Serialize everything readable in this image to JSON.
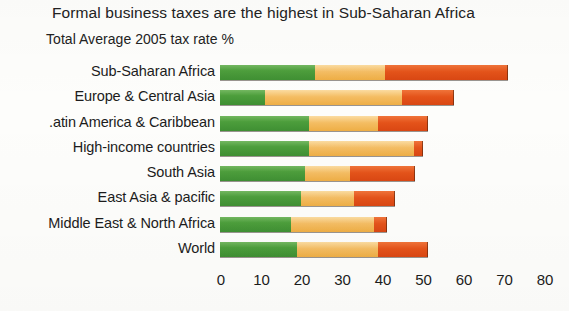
{
  "chart_data": {
    "type": "bar",
    "orientation": "horizontal",
    "stacked": true,
    "title": "Formal business taxes are the highest in Sub-Saharan Africa",
    "subtitle": "Total Average 2005 tax rate %",
    "xlabel": "",
    "ylabel": "",
    "xlim": [
      0,
      80
    ],
    "xticks": [
      0,
      10,
      20,
      30,
      40,
      50,
      60,
      70,
      80
    ],
    "grid": false,
    "legend": "none",
    "categories": [
      "Sub-Saharan Africa",
      ".atin America & Caribbean",
      "Europe & Central Asia",
      "High-income countries",
      "South Asia",
      "East Asia & pacific",
      "Middle East & North Africa",
      "World"
    ],
    "series": [
      {
        "name": "profit-tax",
        "color": "#4d9e3c",
        "values": [
          23.5,
          11,
          22,
          22,
          21,
          20,
          17.5,
          19
        ]
      },
      {
        "name": "labor-tax",
        "color": "#f4bd63",
        "values": [
          17.2,
          34,
          17,
          26,
          11,
          13,
          20.5,
          20
        ]
      },
      {
        "name": "other-taxes",
        "color": "#e4531a",
        "values": [
          30.2,
          12.5,
          12,
          2,
          16,
          10,
          3,
          12
        ]
      }
    ],
    "bars": [
      {
        "label": "Sub-Saharan Africa",
        "segments": [
          23.5,
          17.2,
          30.2
        ],
        "total": 71
      },
      {
        "label": "Europe & Central Asia",
        "segments": [
          11,
          34,
          12.5
        ],
        "total": 57.5
      },
      {
        "label": ".atin America & Caribbean",
        "segments": [
          22,
          17,
          12
        ],
        "total": 51
      },
      {
        "label": "High-income countries",
        "segments": [
          22,
          26,
          2
        ],
        "total": 50
      },
      {
        "label": "South Asia",
        "segments": [
          21,
          11,
          16
        ],
        "total": 48
      },
      {
        "label": "East Asia & pacific",
        "segments": [
          20,
          13,
          10
        ],
        "total": 43
      },
      {
        "label": "Middle East & North Africa",
        "segments": [
          17.5,
          20.5,
          3
        ],
        "total": 41
      },
      {
        "label": "World",
        "segments": [
          19,
          20,
          12
        ],
        "total": 51
      }
    ]
  },
  "axis": {
    "ticks": [
      "0",
      "10",
      "20",
      "30",
      "40",
      "50",
      "60",
      "70",
      "80"
    ]
  },
  "colors": {
    "profit_tax": "#4d9e3c",
    "labor_tax": "#f4bd63",
    "other_taxes": "#e4531a",
    "background": "#fdfdfb",
    "text": "#1c1c1c"
  }
}
